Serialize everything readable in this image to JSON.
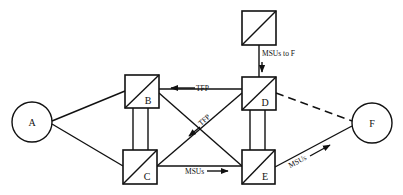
{
  "diagram": {
    "nodes": {
      "A": {
        "label": "A",
        "shape": "circle"
      },
      "B": {
        "label": "B",
        "shape": "signal-transfer-point"
      },
      "C": {
        "label": "C",
        "shape": "signal-transfer-point"
      },
      "D": {
        "label": "D",
        "shape": "signal-transfer-point"
      },
      "E": {
        "label": "E",
        "shape": "signal-transfer-point"
      },
      "F": {
        "label": "F",
        "shape": "circle"
      },
      "top": {
        "label": "",
        "shape": "signal-transfer-point"
      }
    },
    "edge_labels": {
      "d_to_b": "TFP",
      "d_to_c": "TFP",
      "c_to_e": "MSUs",
      "e_to_f": "MSUs",
      "top_to_d": "MSUs to F"
    },
    "edges": [
      {
        "from": "A",
        "to": "B",
        "style": "solid"
      },
      {
        "from": "A",
        "to": "C",
        "style": "solid"
      },
      {
        "from": "B",
        "to": "C",
        "style": "double"
      },
      {
        "from": "D",
        "to": "E",
        "style": "double"
      },
      {
        "from": "B",
        "to": "D",
        "style": "solid",
        "label": "TFP",
        "arrow": "toward B"
      },
      {
        "from": "B",
        "to": "E",
        "style": "solid"
      },
      {
        "from": "C",
        "to": "D",
        "style": "solid",
        "label": "TFP",
        "arrow": "toward C"
      },
      {
        "from": "C",
        "to": "E",
        "style": "solid",
        "label": "MSUs",
        "arrow": "toward E"
      },
      {
        "from": "D",
        "to": "F",
        "style": "dashed"
      },
      {
        "from": "E",
        "to": "F",
        "style": "solid",
        "label": "MSUs",
        "arrow": "toward F"
      },
      {
        "from": "top",
        "to": "D",
        "style": "solid",
        "label": "MSUs to F",
        "arrow": "toward D"
      }
    ]
  }
}
